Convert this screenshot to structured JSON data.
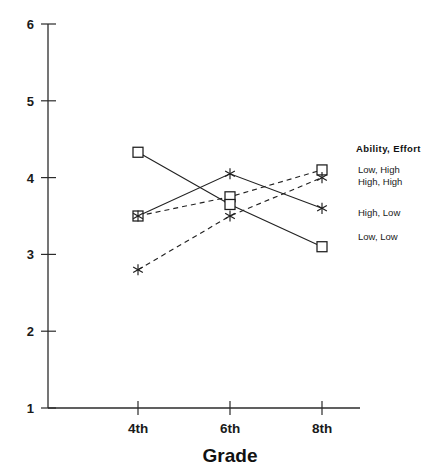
{
  "chart_data": {
    "type": "line",
    "title": "",
    "xlabel": "Grade",
    "ylabel": "",
    "categories": [
      "4th",
      "6th",
      "8th"
    ],
    "ylim": [
      1,
      6
    ],
    "yticks": [
      1,
      2,
      3,
      4,
      5,
      6
    ],
    "grid": false,
    "legend_position": "right",
    "legend_title": "Ability,  Effort",
    "series": [
      {
        "name": "Low, High",
        "marker": "square",
        "linestyle": "dashed",
        "values": [
          3.5,
          3.75,
          4.1
        ]
      },
      {
        "name": "High, High",
        "marker": "star",
        "linestyle": "dashed",
        "values": [
          2.8,
          3.5,
          4.0
        ]
      },
      {
        "name": "High, Low",
        "marker": "star",
        "linestyle": "solid",
        "values": [
          3.5,
          4.05,
          3.6
        ]
      },
      {
        "name": "Low, Low",
        "marker": "square",
        "linestyle": "solid",
        "values": [
          4.33,
          3.65,
          3.1
        ]
      }
    ]
  },
  "axis": {
    "y_tick_labels": [
      "6",
      "5",
      "4",
      "3",
      "2",
      "1"
    ],
    "x_tick_labels": [
      "4th",
      "6th",
      "8th"
    ],
    "x_title": "Grade"
  },
  "legend": {
    "title": "Ability,  Effort",
    "entries": [
      "Low, High",
      "High, High",
      "High, Low",
      "Low, Low"
    ]
  }
}
